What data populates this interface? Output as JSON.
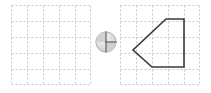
{
  "canvas": {
    "width": 211,
    "height": 93,
    "background": "#ffffff"
  },
  "grids": {
    "columns": 5,
    "rows": 5,
    "cell_size": 16,
    "size": 80,
    "line_color": "#c8c8c8",
    "line_style": "dashed",
    "dash_pattern": "2,2",
    "border_color": "#bdbdbd"
  },
  "panels": [
    {
      "id": "left-grid",
      "name": "empty-grid-panel",
      "label": "Empty 5 by 5 dashed grid",
      "x": 11,
      "y": 5,
      "shape": null
    },
    {
      "id": "right-grid",
      "name": "pentagon-grid-panel",
      "label": "5 by 5 dashed grid containing a pentagon",
      "x": 120,
      "y": 5,
      "shape": {
        "type": "polygon",
        "name": "pentagon-arrow",
        "stroke": "#3a3a3a",
        "stroke_width": 1.6,
        "fill": "none",
        "vertices_grid": [
          [
            3,
            1
          ],
          [
            4,
            1
          ],
          [
            4,
            4
          ],
          [
            2,
            4
          ],
          [
            0.8,
            2.8
          ]
        ],
        "vertices_px": [
          [
            46,
            14
          ],
          [
            64,
            14
          ],
          [
            64,
            62
          ],
          [
            32,
            62
          ],
          [
            13,
            45
          ]
        ]
      }
    }
  ],
  "pie_icon": {
    "name": "pie-circle-icon",
    "label": "Shaded circle with quadrant divider lines",
    "x": 95,
    "y": 31,
    "diameter": 22,
    "fill_light": "#f2f2f2",
    "fill_mid": "#d9d9d9",
    "fill_dark": "#bfbfbf",
    "line_color": "#5a5a5a",
    "outline_color": "#9a9a9a"
  }
}
